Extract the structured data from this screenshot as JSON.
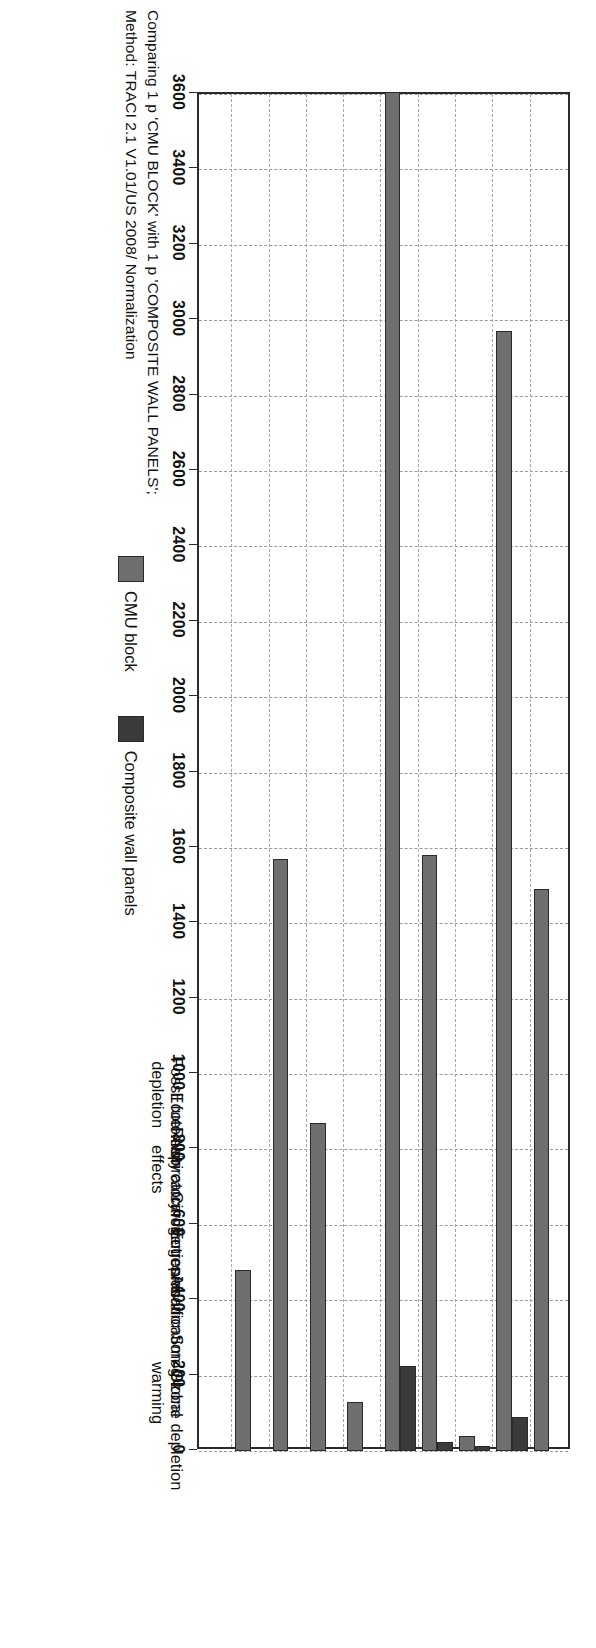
{
  "caption": {
    "line1": "Comparing 1 p 'CMU BLOCK' with 1 p 'COMPOSITE WALL PANELS';",
    "line2": "Method: TRACI 2.1 V1.01/US 2008/ Normalization"
  },
  "legend": {
    "items": [
      {
        "label": "CMU block",
        "color": "#6f6f6f"
      },
      {
        "label": "Composite wall panels",
        "color": "#3a3a3a"
      }
    ]
  },
  "chart_data": {
    "type": "bar",
    "orientation": "horizontal",
    "title": "",
    "subtitle": "Comparing 1 p 'CMU BLOCK' with 1 p 'COMPOSITE WALL PANELS'; Method: TRACI 2.1 V1.01/US 2008/ Normalization",
    "xlabel": "",
    "ylabel": "",
    "grid": true,
    "legend_position": "bottom-right",
    "value_axis": {
      "min": 0,
      "max": 3600,
      "reversed": true,
      "tick_step": 200,
      "ticks": [
        3600,
        3400,
        3200,
        3000,
        2800,
        2600,
        2400,
        2200,
        2000,
        1800,
        1600,
        1400,
        1200,
        1000,
        800,
        600,
        400,
        200,
        0
      ],
      "tick_labels": [
        "3600",
        "3400",
        "3200",
        "3000",
        "2800",
        "2600",
        "2400",
        "2200",
        "2000",
        "1800",
        "1600",
        "1400",
        "1200",
        "1000",
        "800",
        "600",
        "400",
        "200",
        "0"
      ]
    },
    "categories": [
      "Ozone depletion",
      "Global warming",
      "Smog",
      "Acidification",
      "Eutrophication",
      "Carcinogenics",
      "Non carcinogenics",
      "Respiratory effects",
      "Ecotoxicity",
      "Fossil fuel depletion"
    ],
    "category_lines": [
      [
        "Ozone depletion"
      ],
      [
        "Global",
        "warming"
      ],
      [
        "Smog"
      ],
      [
        "Acidification"
      ],
      [
        "Eutrophication"
      ],
      [
        "Carcinogenics"
      ],
      [
        "Non carcinogenics"
      ],
      [
        "Respiratory",
        "effects"
      ],
      [
        "Ecotoxicity"
      ],
      [
        "Fossil fuel",
        "depletion"
      ]
    ],
    "series": [
      {
        "name": "CMU block",
        "color": "#6f6f6f",
        "values": [
          0,
          480,
          1570,
          870,
          130,
          3610,
          1580,
          40,
          2970,
          1490
        ]
      },
      {
        "name": "Composite wall panels",
        "color": "#3a3a3a",
        "values": [
          0,
          0,
          0,
          0,
          0,
          225,
          25,
          12,
          90,
          0
        ]
      }
    ]
  }
}
